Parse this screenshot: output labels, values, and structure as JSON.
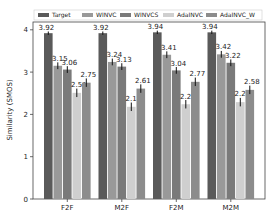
{
  "chart_data": {
    "type": "bar",
    "title": "",
    "xlabel": "",
    "ylabel": "Similarity (SMOS)",
    "ylim": [
      0,
      4.2
    ],
    "yticks": [
      0,
      1,
      2,
      3,
      4
    ],
    "grid": false,
    "legend_position": "top (horizontal, above plot)",
    "categories": [
      "F2F",
      "M2F",
      "F2M",
      "M2M"
    ],
    "series": [
      {
        "name": "Target",
        "color": "#5a5a5a",
        "values": [
          3.92,
          3.92,
          3.94,
          3.94
        ],
        "error": [
          0.04,
          0.04,
          0.04,
          0.04
        ]
      },
      {
        "name": "WINVC",
        "color": "#999999",
        "values": [
          3.15,
          3.24,
          3.41,
          3.42
        ],
        "error": [
          0.08,
          0.08,
          0.08,
          0.08
        ]
      },
      {
        "name": "WINVCS",
        "color": "#7a7a7a",
        "values": [
          3.06,
          3.13,
          3.04,
          3.22
        ],
        "error": [
          0.08,
          0.08,
          0.08,
          0.08
        ]
      },
      {
        "name": "AdaINVC",
        "color": "#cfcfcf",
        "values": [
          2.51,
          2.18,
          2.24,
          2.29
        ],
        "error": [
          0.1,
          0.1,
          0.1,
          0.1
        ]
      },
      {
        "name": "AdaINVC_W",
        "color": "#8c8c8c",
        "values": [
          2.75,
          2.61,
          2.77,
          2.58
        ],
        "error": [
          0.1,
          0.1,
          0.1,
          0.1
        ]
      }
    ]
  }
}
